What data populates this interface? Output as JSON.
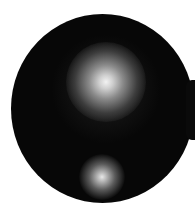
{
  "image": {
    "description": "Circular dark field image with two bright diffuse spots",
    "background_color": "#ffffff",
    "disc_color": "#070707",
    "spots": [
      {
        "name": "upper-bright-spot",
        "relative_size": "large"
      },
      {
        "name": "lower-bright-spot",
        "relative_size": "small"
      }
    ]
  }
}
